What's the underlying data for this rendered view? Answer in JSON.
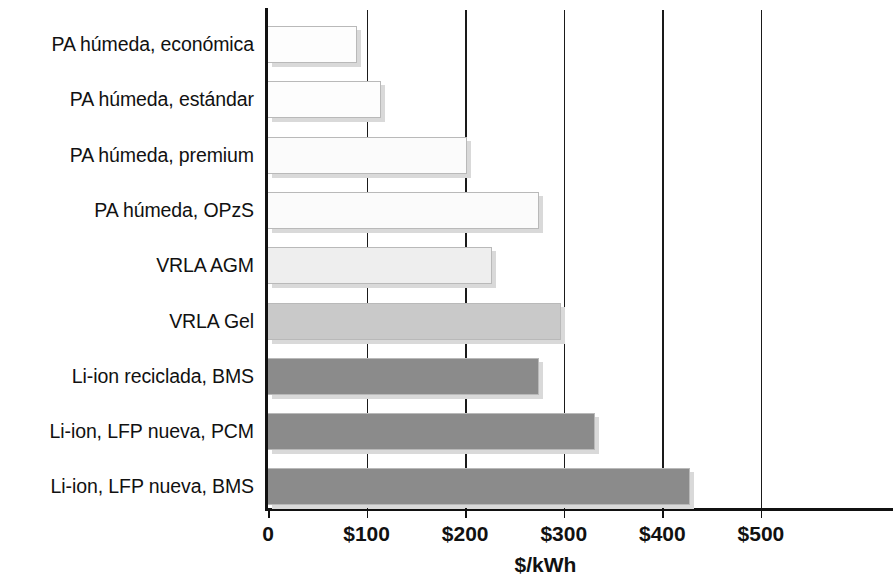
{
  "chart_data": {
    "type": "bar",
    "orientation": "horizontal",
    "title": "",
    "subtitle": "",
    "xlabel": "$/kWh",
    "ylabel": "",
    "xlim": [
      0,
      563
    ],
    "grid": true,
    "legend": "none",
    "tick_labels": [
      "0",
      "$100",
      "$200",
      "$300",
      "$400",
      "$500"
    ],
    "tick_values": [
      0,
      100,
      200,
      300,
      400,
      500
    ],
    "categories": [
      "PA húmeda, económica",
      "PA húmeda, estándar",
      "PA húmeda, premium",
      "PA húmeda, OPzS",
      "VRLA AGM",
      "VRLA Gel",
      "Li-ion reciclada, BMS",
      "Li-ion, LFP nueva, PCM",
      "Li-ion, LFP nueva, BMS"
    ],
    "values": [
      90,
      115,
      202,
      275,
      227,
      297,
      275,
      332,
      428
    ],
    "bar_colors": [
      "#fdfdfd",
      "#fdfdfd",
      "#fbfbfb",
      "#fbfbfb",
      "#eeeeee",
      "#c9c9c9",
      "#8b8b8b",
      "#8b8b8b",
      "#8b8b8b"
    ],
    "units": "$/kWh"
  },
  "axis": {
    "title": "$/kWh",
    "tick_0": "0",
    "tick_100": "$100",
    "tick_200": "$200",
    "tick_300": "$300",
    "tick_400": "$400",
    "tick_500": "$500"
  }
}
